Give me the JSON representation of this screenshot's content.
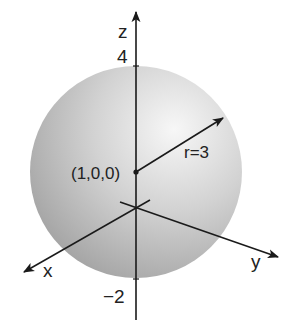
{
  "diagram": {
    "axes": {
      "z_label": "z",
      "x_label": "x",
      "y_label": "y",
      "z_tick_top": "4",
      "z_tick_bottom": "−2"
    },
    "center_label": "(1,0,0)",
    "radius_label": "r=3",
    "colors": {
      "sphere_light": "#f4f4f4",
      "sphere_dark": "#9a9a9a",
      "axis": "#1a1a1a"
    }
  }
}
